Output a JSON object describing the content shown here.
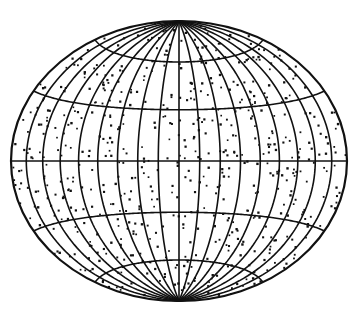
{
  "figure": {
    "description": "Equal-area elliptical projection of the sky/globe with uniformly scattered random points",
    "projection": "hammer",
    "center": [
      179,
      161
    ],
    "semi_axes": [
      168,
      140
    ],
    "meridian_step_deg": 20,
    "parallel_step_deg": 30,
    "line_color": "#111111",
    "dot_color": "#111111",
    "background": "#ffffff",
    "dot_count": 620,
    "seed": 17
  }
}
